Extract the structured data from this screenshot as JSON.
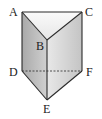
{
  "diagram": {
    "type": "triangular-prism",
    "vertices": {
      "A": {
        "label": "A",
        "x": 22,
        "y": 12
      },
      "B": {
        "label": "B",
        "x": 47,
        "y": 40
      },
      "C": {
        "label": "C",
        "x": 82,
        "y": 12
      },
      "D": {
        "label": "D",
        "x": 22,
        "y": 71
      },
      "E": {
        "label": "E",
        "x": 47,
        "y": 100
      },
      "F": {
        "label": "F",
        "x": 82,
        "y": 71
      }
    },
    "hidden_edges": [
      "DF"
    ],
    "colors": {
      "edge": "#2a2a2a",
      "top_face": "#f2f2f2",
      "left_face": "#b8b8b8",
      "right_face": "#d8d8d8"
    }
  }
}
